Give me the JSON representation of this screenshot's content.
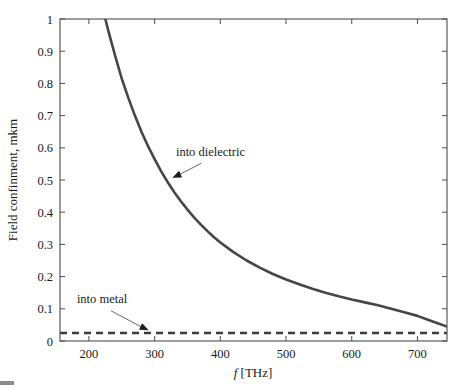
{
  "chart_data": {
    "type": "line",
    "title": "",
    "subtitle": "",
    "xlabel": "f [THz]",
    "xlabel_italic_part": "f",
    "xlabel_rest": " [THz]",
    "ylabel": "Field confinment, mkm",
    "xlim": [
      156,
      745
    ],
    "ylim": [
      0,
      1
    ],
    "xticks": [
      200,
      300,
      400,
      500,
      600,
      700
    ],
    "xticklabels": [
      "200",
      "300",
      "400",
      "500",
      "600",
      "700"
    ],
    "yticks": [
      0,
      0.1,
      0.2,
      0.3,
      0.4,
      0.5,
      0.6,
      0.7,
      0.8,
      0.9,
      1
    ],
    "yticklabels": [
      "0",
      "0.1",
      "0.2",
      "0.3",
      "0.4",
      "0.5",
      "0.6",
      "0.7",
      "0.8",
      "0.9",
      "1"
    ],
    "grid": false,
    "legend": "none",
    "series": [
      {
        "name": "into dielectric",
        "style": "solid",
        "color": "#464646",
        "x": [
          225,
          230,
          240,
          250,
          260,
          270,
          280,
          290,
          300,
          310,
          320,
          330,
          340,
          350,
          360,
          370,
          380,
          390,
          400,
          420,
          440,
          460,
          480,
          500,
          520,
          540,
          560,
          580,
          600,
          620,
          640,
          660,
          680,
          700,
          720,
          745
        ],
        "values": [
          1.0,
          0.96,
          0.885,
          0.815,
          0.755,
          0.7,
          0.65,
          0.605,
          0.565,
          0.527,
          0.493,
          0.462,
          0.434,
          0.408,
          0.384,
          0.362,
          0.342,
          0.323,
          0.306,
          0.276,
          0.25,
          0.228,
          0.208,
          0.191,
          0.176,
          0.162,
          0.15,
          0.139,
          0.129,
          0.12,
          0.111,
          0.1,
          0.089,
          0.078,
          0.063,
          0.045
        ]
      },
      {
        "name": "into metal",
        "style": "dashed",
        "color": "#3c3c3c",
        "x": [
          156,
          745
        ],
        "values": [
          0.025,
          0.025
        ]
      }
    ],
    "annotations": [
      {
        "text": "into dielectric",
        "text_x": 385,
        "text_y": 0.575,
        "arrow_tip_x": 327,
        "arrow_tip_y": 0.507,
        "target_series": "into dielectric"
      },
      {
        "text": "into metal",
        "text_x": 220,
        "text_y": 0.117,
        "arrow_tip_x": 291,
        "arrow_tip_y": 0.033,
        "target_series": "into metal"
      }
    ]
  },
  "colors": {
    "background": "#ffffff",
    "axis": "#4d4d4d",
    "text": "#1a1a1a",
    "dielectric": "#464646",
    "metal": "#3c3c3c",
    "leader": "#555555"
  }
}
